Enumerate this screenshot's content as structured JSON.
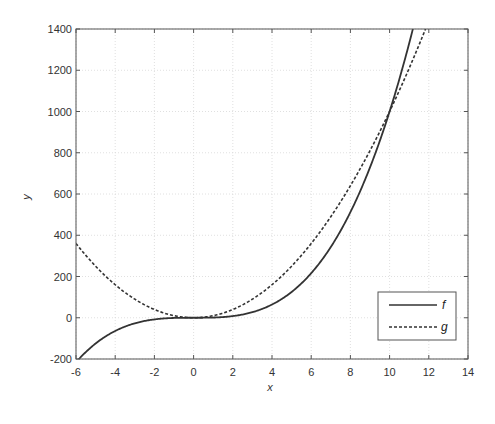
{
  "chart_data": {
    "type": "line",
    "title": "",
    "xlabel": "x",
    "ylabel": "y",
    "xlim": [
      -6,
      14
    ],
    "ylim": [
      -200,
      1400
    ],
    "xticks": [
      -6,
      -4,
      -2,
      0,
      2,
      4,
      6,
      8,
      10,
      12,
      14
    ],
    "yticks": [
      -200,
      0,
      200,
      400,
      600,
      800,
      1000,
      1200,
      1400
    ],
    "grid": true,
    "legend_position": "lower right",
    "series": [
      {
        "name": "f",
        "style": "solid",
        "color": "#333333",
        "expression": "x^3",
        "x": [
          -6,
          -5,
          -4,
          -3,
          -2,
          -1,
          0,
          1,
          2,
          3,
          4,
          5,
          6,
          7,
          8,
          9,
          10,
          11
        ],
        "values": [
          -216,
          -125,
          -64,
          -27,
          -8,
          -1,
          0,
          1,
          8,
          27,
          64,
          125,
          216,
          343,
          512,
          729,
          1000,
          1331
        ]
      },
      {
        "name": "g",
        "style": "dashed",
        "color": "#333333",
        "expression": "10x^2",
        "x": [
          -6,
          -5,
          -4,
          -3,
          -2,
          -1,
          0,
          1,
          2,
          3,
          4,
          5,
          6,
          7,
          8,
          9,
          10,
          11,
          12
        ],
        "values": [
          360,
          250,
          160,
          90,
          40,
          10,
          0,
          10,
          40,
          90,
          160,
          250,
          360,
          490,
          640,
          810,
          1000,
          1210,
          1440
        ]
      }
    ]
  }
}
